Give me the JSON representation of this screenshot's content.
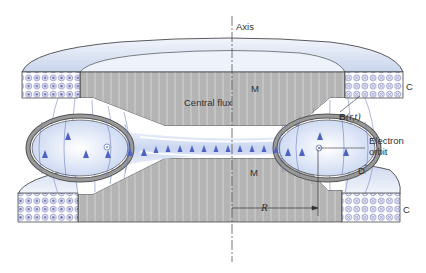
{
  "figure": {
    "labels": {
      "axis": "Axis",
      "magnet_top": "M",
      "magnet_bottom": "M",
      "central_flux": "Central flux",
      "field_symbol": "B",
      "field_args": "(r,t)",
      "electron_orbit_line1": "Electron",
      "electron_orbit_line2": "orbit",
      "donut": "D",
      "coil_top": "C",
      "coil_bottom": "C",
      "radius": "R"
    },
    "components": [
      {
        "id": "M",
        "name": "Magnet pole pieces",
        "color": "#b4b4b4"
      },
      {
        "id": "C",
        "name": "Field coils",
        "left_current": "out-of-page (dots)",
        "right_current": "into-page (crosses)"
      },
      {
        "id": "D",
        "name": "Doughnut vacuum chamber"
      },
      {
        "id": "B(r,t)",
        "name": "Time-varying magnetic field lines",
        "direction": "upward"
      }
    ],
    "colors": {
      "magnet_gray": "#b4b4b4",
      "magnet_stripe": "#d4d4d4",
      "field_blue": "#5a6fc8",
      "cap_light": "#dfe6f3",
      "donut_fill": "#d6e1f5",
      "coil_dot": "#6a6fb0",
      "outline": "#333333"
    }
  }
}
